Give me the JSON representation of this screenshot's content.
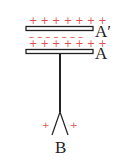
{
  "diagram": {
    "labels": {
      "plate_top": "A′",
      "plate_bottom": "A",
      "leaves": "B"
    },
    "charges": {
      "row_top": "+ + + + + + +",
      "row_middle": "– – – – – – –",
      "row_bottom": "+ + + + + + +",
      "leaf_left": "+",
      "leaf_right": "+"
    },
    "colors": {
      "charge": "#e05050",
      "line": "#222222"
    }
  }
}
